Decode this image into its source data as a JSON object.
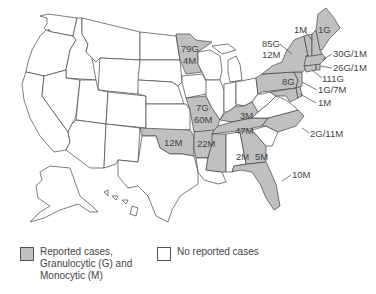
{
  "map": {
    "reported_fill": "#c0c0c0",
    "unreported_fill": "#ffffff",
    "states": {
      "MN": {
        "label1": "79G",
        "label2": "4M"
      },
      "MO": {
        "label1": "7G",
        "label2": "60M"
      },
      "OK": {
        "label1": "12M"
      },
      "AR": {
        "label1": "22M"
      },
      "TN": {
        "label1": "47M"
      },
      "KY": {
        "label1": "3M"
      },
      "PA": {
        "label1": "8G"
      },
      "MS": {
        "label1": "2M"
      },
      "GA": {
        "label1": "5M"
      }
    },
    "callouts": {
      "VT": "1M",
      "ME": "1G",
      "NY1": "85G",
      "NY2": "12M",
      "MA": "30G/1M",
      "RI": "26G/1M",
      "CT": "111G",
      "NJ": "1G/7M",
      "MD": "1M",
      "NC": "2G/11M",
      "FL": "10M"
    }
  },
  "legend": {
    "reported_line1": "Reported cases,",
    "reported_line2": "Granulocytic (G) and",
    "reported_line3": "Monocytic (M)",
    "unreported": "No reported cases"
  }
}
